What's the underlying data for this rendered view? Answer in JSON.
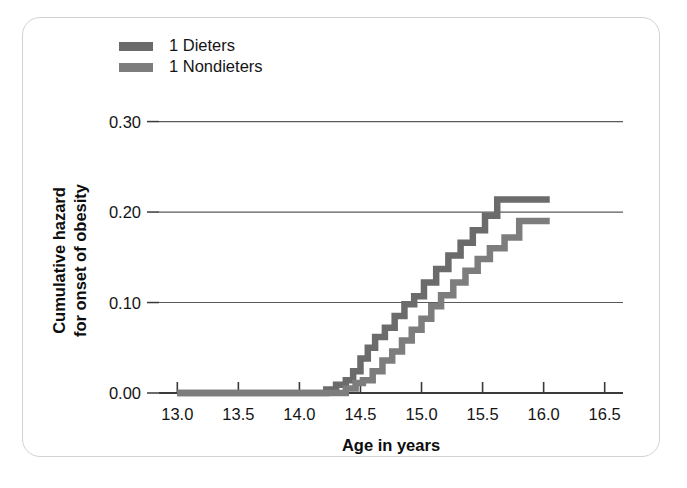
{
  "figure": {
    "background_color": "#ffffff",
    "card_border_color": "#d2d2d2",
    "axis_color": "#3a3a3a",
    "gridline_color": "#5a5a5a"
  },
  "legend": {
    "position": "top-left",
    "entries": [
      {
        "label": "1 Dieters",
        "color": "#6b6b6b",
        "swatch": "legend-swatch-dieters"
      },
      {
        "label": "1 Nondieters",
        "color": "#7d7d7d",
        "swatch": "legend-swatch-nondieters"
      }
    ]
  },
  "chart_data": {
    "type": "line",
    "subtype": "step",
    "title": "",
    "xlabel": "Age in years",
    "ylabel": "Cumulative hazard for onset of obesity",
    "ylabel_lines": [
      "Cumulative hazard",
      "for onset of obesity"
    ],
    "xlim": [
      12.85,
      16.65
    ],
    "ylim": [
      0.0,
      0.315
    ],
    "xticks": [
      13.0,
      13.5,
      14.0,
      14.5,
      15.0,
      15.5,
      16.0,
      16.5
    ],
    "xtick_labels": [
      "13.0",
      "13.5",
      "14.0",
      "14.5",
      "15.0",
      "15.5",
      "16.0",
      "16.5"
    ],
    "yticks": [
      0.0,
      0.1,
      0.2,
      0.3
    ],
    "ytick_labels": [
      "0.00",
      "0.10",
      "0.20",
      "0.30"
    ],
    "grid": "horizontal",
    "legend_position": "upper left",
    "series": [
      {
        "name": "1 Dieters",
        "color": "#6b6b6b",
        "points": [
          [
            13.0,
            0.0
          ],
          [
            14.15,
            0.0
          ],
          [
            14.22,
            0.004
          ],
          [
            14.3,
            0.009
          ],
          [
            14.38,
            0.014
          ],
          [
            14.44,
            0.024
          ],
          [
            14.5,
            0.038
          ],
          [
            14.56,
            0.05
          ],
          [
            14.62,
            0.062
          ],
          [
            14.7,
            0.072
          ],
          [
            14.78,
            0.085
          ],
          [
            14.86,
            0.098
          ],
          [
            14.94,
            0.107
          ],
          [
            15.02,
            0.122
          ],
          [
            15.12,
            0.137
          ],
          [
            15.22,
            0.152
          ],
          [
            15.32,
            0.166
          ],
          [
            15.42,
            0.18
          ],
          [
            15.52,
            0.196
          ],
          [
            15.62,
            0.214
          ],
          [
            16.05,
            0.214
          ]
        ]
      },
      {
        "name": "1 Nondieters",
        "color": "#7d7d7d",
        "points": [
          [
            13.0,
            0.0
          ],
          [
            14.3,
            0.0
          ],
          [
            14.38,
            0.005
          ],
          [
            14.46,
            0.011
          ],
          [
            14.52,
            0.014
          ],
          [
            14.6,
            0.024
          ],
          [
            14.68,
            0.036
          ],
          [
            14.76,
            0.046
          ],
          [
            14.84,
            0.058
          ],
          [
            14.92,
            0.07
          ],
          [
            15.0,
            0.082
          ],
          [
            15.08,
            0.096
          ],
          [
            15.16,
            0.108
          ],
          [
            15.26,
            0.122
          ],
          [
            15.36,
            0.135
          ],
          [
            15.46,
            0.148
          ],
          [
            15.56,
            0.16
          ],
          [
            15.68,
            0.172
          ],
          [
            15.8,
            0.19
          ],
          [
            16.05,
            0.19
          ]
        ]
      }
    ]
  }
}
